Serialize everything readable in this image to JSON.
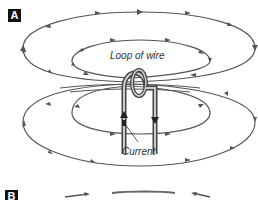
{
  "panels": [
    {
      "label": "A"
    },
    {
      "label": "B"
    }
  ],
  "annotations": {
    "loop": "Loop of wire",
    "current": "Current"
  },
  "colors": {
    "field_line": "#555555",
    "wire": "#444444",
    "label_bg": "#111111"
  }
}
